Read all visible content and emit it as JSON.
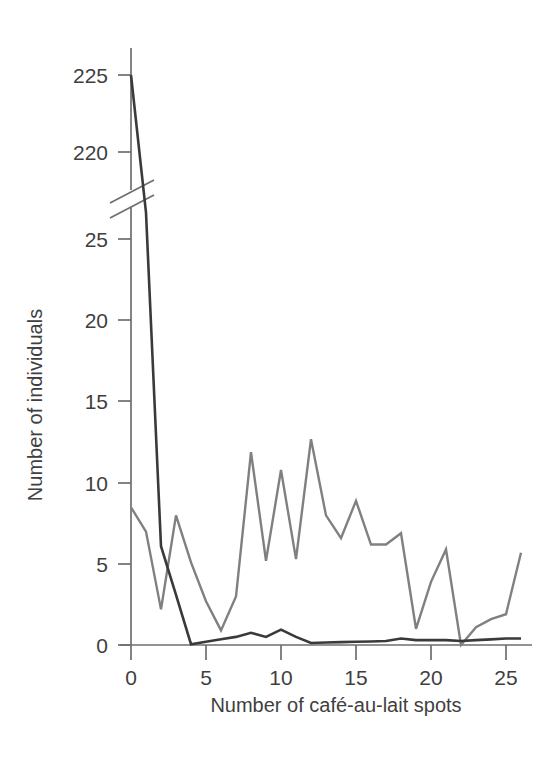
{
  "chart_data": {
    "type": "line",
    "title": "",
    "xlabel": "Number of café-au-lait spots",
    "ylabel": "Number of individuals",
    "x": [
      0,
      1,
      2,
      3,
      4,
      5,
      6,
      7,
      8,
      9,
      10,
      11,
      12,
      13,
      14,
      15,
      16,
      17,
      18,
      19,
      20,
      21,
      22,
      23,
      24,
      25,
      26
    ],
    "xlim": [
      0,
      26
    ],
    "xticks": [
      0,
      5,
      10,
      15,
      20,
      25
    ],
    "xticklabels": [
      "0",
      "5",
      "10",
      "15",
      "20",
      "25"
    ],
    "yticks_lower": [
      0,
      5,
      10,
      15,
      20,
      25
    ],
    "yticklabels_lower": [
      "0",
      "5",
      "10",
      "15",
      "20",
      "25"
    ],
    "yticks_upper": [
      220,
      225
    ],
    "yticklabels_upper": [
      "220",
      "225"
    ],
    "ylim_lower": [
      0,
      26
    ],
    "ylim_upper": [
      218,
      226
    ],
    "axis_break": true,
    "axis_break_label": "broken y-axis between 26 and 218",
    "grid": false,
    "legend": "none",
    "series": [
      {
        "name": "dark-series",
        "color": "#3a3a3a",
        "values": [
          225.0,
          103.0,
          6.1,
          3.1,
          0.05,
          0.2,
          0.35,
          0.5,
          0.75,
          0.5,
          0.95,
          0.5,
          0.12,
          0.15,
          0.18,
          0.2,
          0.22,
          0.25,
          0.4,
          0.3,
          0.3,
          0.3,
          0.25,
          0.3,
          0.35,
          0.4,
          0.4
        ]
      },
      {
        "name": "gray-series",
        "color": "#808080",
        "values": [
          8.5,
          7.0,
          2.2,
          8.0,
          5.1,
          2.7,
          0.9,
          3.0,
          11.9,
          5.2,
          10.8,
          5.3,
          12.7,
          8.0,
          6.6,
          8.9,
          6.2,
          6.2,
          6.9,
          1.0,
          3.9,
          5.9,
          0.0,
          1.1,
          1.6,
          1.9,
          5.7
        ]
      }
    ]
  }
}
